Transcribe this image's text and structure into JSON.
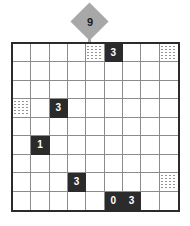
{
  "puzzle": {
    "type": "grid-logic-puzzle",
    "grid": {
      "columns": 9,
      "rows": 9
    },
    "top_marker": {
      "shape": "diamond",
      "value": "9",
      "column": 5,
      "fill_color": "#a8a8a8",
      "text_color": "#1a1a1a"
    },
    "clue_color": "#2b2b2b",
    "clue_text_color": "#ffffff",
    "grid_line_color": "#8c8c8c",
    "border_color": "#2b2b2b",
    "cells": [
      [
        {
          "kind": "empty",
          "value": ""
        },
        {
          "kind": "empty",
          "value": ""
        },
        {
          "kind": "empty",
          "value": ""
        },
        {
          "kind": "empty",
          "value": ""
        },
        {
          "kind": "water",
          "value": ""
        },
        {
          "kind": "clue",
          "value": "3"
        },
        {
          "kind": "empty",
          "value": ""
        },
        {
          "kind": "empty",
          "value": ""
        },
        {
          "kind": "water",
          "value": ""
        }
      ],
      [
        {
          "kind": "empty",
          "value": ""
        },
        {
          "kind": "empty",
          "value": ""
        },
        {
          "kind": "empty",
          "value": ""
        },
        {
          "kind": "empty",
          "value": ""
        },
        {
          "kind": "empty",
          "value": ""
        },
        {
          "kind": "empty",
          "value": ""
        },
        {
          "kind": "empty",
          "value": ""
        },
        {
          "kind": "empty",
          "value": ""
        },
        {
          "kind": "empty",
          "value": ""
        }
      ],
      [
        {
          "kind": "empty",
          "value": ""
        },
        {
          "kind": "empty",
          "value": ""
        },
        {
          "kind": "empty",
          "value": ""
        },
        {
          "kind": "empty",
          "value": ""
        },
        {
          "kind": "empty",
          "value": ""
        },
        {
          "kind": "empty",
          "value": ""
        },
        {
          "kind": "empty",
          "value": ""
        },
        {
          "kind": "empty",
          "value": ""
        },
        {
          "kind": "empty",
          "value": ""
        }
      ],
      [
        {
          "kind": "water",
          "value": ""
        },
        {
          "kind": "empty",
          "value": ""
        },
        {
          "kind": "clue",
          "value": "3"
        },
        {
          "kind": "empty",
          "value": ""
        },
        {
          "kind": "empty",
          "value": ""
        },
        {
          "kind": "empty",
          "value": ""
        },
        {
          "kind": "empty",
          "value": ""
        },
        {
          "kind": "empty",
          "value": ""
        },
        {
          "kind": "empty",
          "value": ""
        }
      ],
      [
        {
          "kind": "empty",
          "value": ""
        },
        {
          "kind": "empty",
          "value": ""
        },
        {
          "kind": "empty",
          "value": ""
        },
        {
          "kind": "empty",
          "value": ""
        },
        {
          "kind": "empty",
          "value": ""
        },
        {
          "kind": "empty",
          "value": ""
        },
        {
          "kind": "empty",
          "value": ""
        },
        {
          "kind": "empty",
          "value": ""
        },
        {
          "kind": "empty",
          "value": ""
        }
      ],
      [
        {
          "kind": "empty",
          "value": ""
        },
        {
          "kind": "clue",
          "value": "1"
        },
        {
          "kind": "empty",
          "value": ""
        },
        {
          "kind": "empty",
          "value": ""
        },
        {
          "kind": "empty",
          "value": ""
        },
        {
          "kind": "empty",
          "value": ""
        },
        {
          "kind": "empty",
          "value": ""
        },
        {
          "kind": "empty",
          "value": ""
        },
        {
          "kind": "empty",
          "value": ""
        }
      ],
      [
        {
          "kind": "empty",
          "value": ""
        },
        {
          "kind": "empty",
          "value": ""
        },
        {
          "kind": "empty",
          "value": ""
        },
        {
          "kind": "empty",
          "value": ""
        },
        {
          "kind": "empty",
          "value": ""
        },
        {
          "kind": "empty",
          "value": ""
        },
        {
          "kind": "empty",
          "value": ""
        },
        {
          "kind": "empty",
          "value": ""
        },
        {
          "kind": "empty",
          "value": ""
        }
      ],
      [
        {
          "kind": "empty",
          "value": ""
        },
        {
          "kind": "empty",
          "value": ""
        },
        {
          "kind": "empty",
          "value": ""
        },
        {
          "kind": "clue",
          "value": "3"
        },
        {
          "kind": "empty",
          "value": ""
        },
        {
          "kind": "empty",
          "value": ""
        },
        {
          "kind": "empty",
          "value": ""
        },
        {
          "kind": "empty",
          "value": ""
        },
        {
          "kind": "water",
          "value": ""
        }
      ],
      [
        {
          "kind": "empty",
          "value": ""
        },
        {
          "kind": "empty",
          "value": ""
        },
        {
          "kind": "empty",
          "value": ""
        },
        {
          "kind": "empty",
          "value": ""
        },
        {
          "kind": "empty",
          "value": ""
        },
        {
          "kind": "clue",
          "value": "0"
        },
        {
          "kind": "clue",
          "value": "3"
        },
        {
          "kind": "empty",
          "value": ""
        },
        {
          "kind": "empty",
          "value": ""
        }
      ]
    ]
  }
}
